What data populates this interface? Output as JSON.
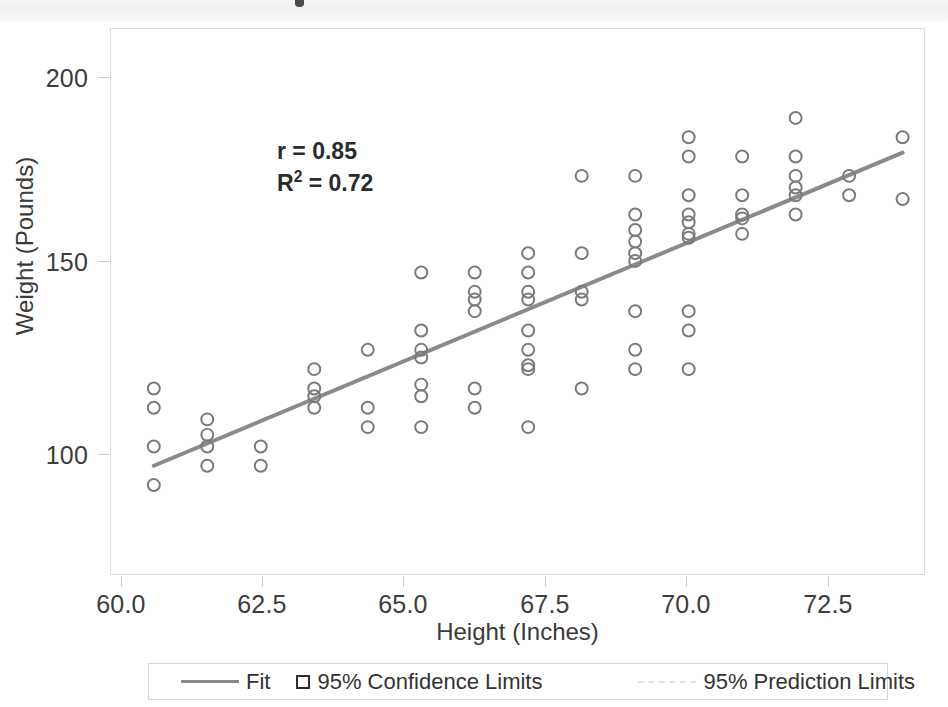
{
  "chart_data": {
    "type": "scatter",
    "title": "",
    "xlabel": "Height (Inches)",
    "ylabel": "Weight (Pounds)",
    "xlim": [
      59.2,
      74.4
    ],
    "ylim": [
      72,
      213
    ],
    "xticks": [
      "60.0",
      "62.5",
      "65.0",
      "67.5",
      "70.0",
      "72.5"
    ],
    "xtick_values": [
      60.0,
      62.5,
      65.0,
      67.5,
      70.0,
      72.5
    ],
    "yticks": [
      "200",
      "150",
      "100"
    ],
    "ytick_values": [
      200,
      150,
      100
    ],
    "grid": false,
    "legend_position": "below-axes",
    "annotations": {
      "r_label": "r = 0.85",
      "r_value": 0.85,
      "r2_label_prefix": "R",
      "r2_label_suffix": " = 0.72",
      "r2_exponent": "2",
      "r2_value": 0.72
    },
    "series": [
      {
        "name": "Observations",
        "marker": "open-circle",
        "color": "#7a7a7a",
        "points": [
          [
            60,
            120
          ],
          [
            60,
            115
          ],
          [
            60,
            105
          ],
          [
            60,
            95
          ],
          [
            61,
            112
          ],
          [
            61,
            108
          ],
          [
            61,
            105
          ],
          [
            61,
            100
          ],
          [
            62,
            105
          ],
          [
            62,
            100
          ],
          [
            63,
            125
          ],
          [
            63,
            120
          ],
          [
            63,
            118
          ],
          [
            63,
            115
          ],
          [
            64,
            130
          ],
          [
            64,
            115
          ],
          [
            64,
            110
          ],
          [
            65,
            150
          ],
          [
            65,
            135
          ],
          [
            65,
            130
          ],
          [
            65,
            128
          ],
          [
            65,
            121
          ],
          [
            65,
            118
          ],
          [
            65,
            110
          ],
          [
            66,
            150
          ],
          [
            66,
            145
          ],
          [
            66,
            143
          ],
          [
            66,
            140
          ],
          [
            66,
            120
          ],
          [
            66,
            115
          ],
          [
            67,
            155
          ],
          [
            67,
            150
          ],
          [
            67,
            145
          ],
          [
            67,
            143
          ],
          [
            67,
            135
          ],
          [
            67,
            130
          ],
          [
            67,
            126
          ],
          [
            67,
            125
          ],
          [
            67,
            110
          ],
          [
            68,
            175
          ],
          [
            68,
            155
          ],
          [
            68,
            145
          ],
          [
            68,
            143
          ],
          [
            68,
            120
          ],
          [
            69,
            175
          ],
          [
            69,
            165
          ],
          [
            69,
            161
          ],
          [
            69,
            158
          ],
          [
            69,
            155
          ],
          [
            69,
            153
          ],
          [
            69,
            140
          ],
          [
            69,
            130
          ],
          [
            69,
            125
          ],
          [
            70,
            185
          ],
          [
            70,
            180
          ],
          [
            70,
            170
          ],
          [
            70,
            165
          ],
          [
            70,
            163
          ],
          [
            70,
            160
          ],
          [
            70,
            159
          ],
          [
            70,
            140
          ],
          [
            70,
            135
          ],
          [
            70,
            125
          ],
          [
            71,
            180
          ],
          [
            71,
            170
          ],
          [
            71,
            165
          ],
          [
            71,
            164
          ],
          [
            71,
            160
          ],
          [
            72,
            190
          ],
          [
            72,
            180
          ],
          [
            72,
            175
          ],
          [
            72,
            172
          ],
          [
            72,
            170
          ],
          [
            72,
            165
          ],
          [
            73,
            175
          ],
          [
            73,
            170
          ],
          [
            74,
            185
          ],
          [
            74,
            169
          ]
        ]
      }
    ],
    "fit_line": {
      "name": "Fit",
      "color": "#8a8a8a",
      "x_start": 60.0,
      "y_start": 100,
      "x_end": 74.0,
      "y_end": 181
    },
    "legend": [
      {
        "label": "Fit",
        "marker": "line",
        "color": "#8a8a8a"
      },
      {
        "label": "95% Confidence Limits",
        "marker": "square",
        "color": "#2e2e2e"
      },
      {
        "label": "95% Prediction Limits",
        "marker": "dashed-line",
        "color": "#e2e2e2"
      }
    ]
  }
}
